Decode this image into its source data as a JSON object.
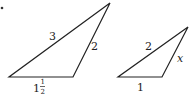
{
  "figure": {
    "bullet": "•",
    "triangles": [
      {
        "name": "left-triangle",
        "vertices": [
          [
            9,
            77
          ],
          [
            73,
            77
          ],
          [
            110,
            3
          ]
        ],
        "labels": {
          "hypotenuse": "3",
          "right_side": "2",
          "base_whole": "1",
          "base_num": "1",
          "base_den": "2"
        }
      },
      {
        "name": "right-triangle",
        "vertices": [
          [
            118,
            77
          ],
          [
            162,
            77
          ],
          [
            188,
            27
          ]
        ],
        "labels": {
          "hypotenuse": "2",
          "right_side": "x",
          "base": "1"
        }
      }
    ],
    "stroke_color": "#222222"
  }
}
